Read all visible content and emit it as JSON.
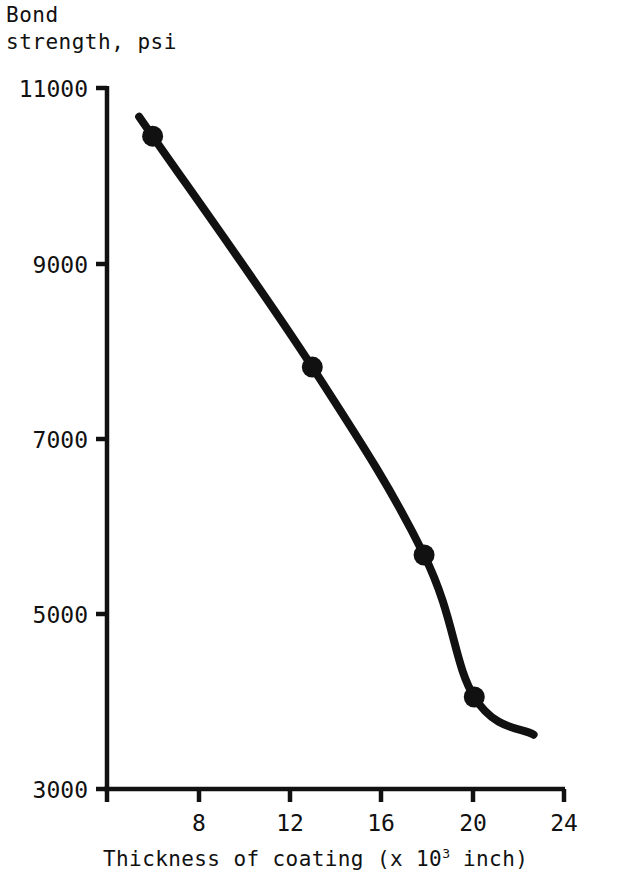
{
  "chart_data": {
    "type": "line",
    "title": "",
    "ylabel": "Bond\nstrength, psi",
    "ylabel_line1": "Bond",
    "ylabel_line2": "strength, psi",
    "xlabel_prefix": "Thickness of coating (x 10",
    "xlabel_exponent": "3",
    "xlabel_suffix": " inch)",
    "xlabel": "Thickness of coating (x 10^3 inch)",
    "x": [
      5.9,
      12.9,
      17.8,
      20.0
    ],
    "values": [
      10450,
      7815,
      5670,
      4050
    ],
    "series": [
      {
        "name": "Bond strength vs coating thickness",
        "x": [
          5.9,
          12.9,
          17.8,
          20.0
        ],
        "values": [
          10450,
          7815,
          5670,
          4050
        ]
      }
    ],
    "xticks": [
      8,
      12,
      16,
      20,
      24
    ],
    "xtick_labels": [
      "8",
      "12",
      "16",
      "20",
      "24"
    ],
    "yticks": [
      3000,
      5000,
      7000,
      9000,
      11000
    ],
    "ytick_labels": [
      "3000",
      "5000",
      "7000",
      "9000",
      "11000"
    ],
    "xlim": [
      3.9,
      24.2
    ],
    "ylim": [
      3000,
      11000
    ],
    "grid": false,
    "legend": "none",
    "marker": "filled-circle",
    "line_color": "#111111",
    "marker_color": "#111111",
    "axis_color": "#111111",
    "background_color": "#ffffff",
    "curve_start": {
      "x": 5.9,
      "y": 10450
    },
    "curve_end": {
      "x": 22.6,
      "y": 3620
    },
    "note": "Monotonically decreasing double-sigmoid (S-shaped) curve through four measured points"
  },
  "axis": {
    "y_tick_11000": "11000",
    "y_tick_9000": "9000",
    "y_tick_7000": "7000",
    "y_tick_5000": "5000",
    "y_tick_3000": "3000",
    "x_tick_8": "8",
    "x_tick_12": "12",
    "x_tick_16": "16",
    "x_tick_20": "20",
    "x_tick_24": "24"
  }
}
